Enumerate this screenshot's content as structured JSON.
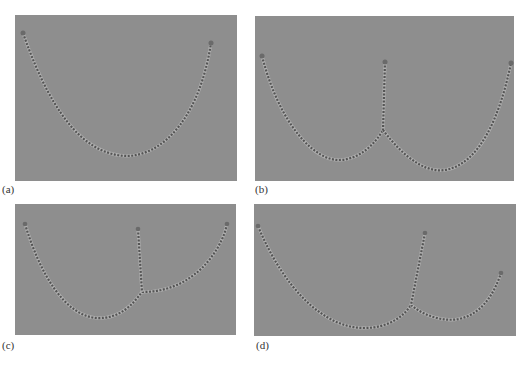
{
  "figure": {
    "panels": [
      {
        "id": "a",
        "label": "(a)",
        "description": "single hanging chain (catenary)"
      },
      {
        "id": "b",
        "label": "(b)",
        "description": "two catenaries joined at a point with a vertical chain from above"
      },
      {
        "id": "c",
        "label": "(c)",
        "description": "asymmetric joined chains with vertical segment, junction right of center"
      },
      {
        "id": "d",
        "label": "(d)",
        "description": "asymmetric joined chains, right anchor lower"
      }
    ]
  },
  "colors": {
    "panel_background": "#8e8e8e",
    "chain_dark": "#5a5a5a",
    "chain_light": "#b5b5b5"
  }
}
